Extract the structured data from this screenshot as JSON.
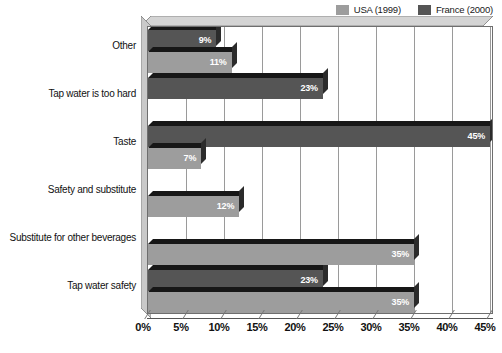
{
  "chart_data": {
    "type": "bar",
    "orientation": "horizontal",
    "title": "",
    "subtitle": "",
    "xlabel": "",
    "ylabel": "",
    "xlim": [
      0,
      45
    ],
    "xtick_labels": [
      "0%",
      "5%",
      "10%",
      "15%",
      "20%",
      "25%",
      "30%",
      "35%",
      "40%",
      "45%"
    ],
    "xtick_values": [
      0,
      5,
      10,
      15,
      20,
      25,
      30,
      35,
      40,
      45
    ],
    "grid": "vertical",
    "legend_position": "top-right",
    "categories": [
      "Other",
      "Tap water is too hard",
      "Taste",
      "Safety and substitute",
      "Substitute for other beverages",
      "Tap water safety"
    ],
    "series": [
      {
        "name": "USA (1999)",
        "color": "#9d9d9d",
        "values": [
          11,
          0,
          7,
          12,
          35,
          35
        ],
        "labels": [
          "11%",
          "",
          "7%",
          "12%",
          "35%",
          "35%"
        ]
      },
      {
        "name": "France (2000)",
        "color": "#555555",
        "values": [
          9,
          23,
          45,
          0,
          0,
          23
        ],
        "labels": [
          "9%",
          "23%",
          "45%",
          "",
          "",
          "23%"
        ]
      }
    ]
  },
  "legend": {
    "entries": [
      {
        "label": "USA (1999)",
        "color": "#9d9d9d"
      },
      {
        "label": "France (2000)",
        "color": "#555555"
      }
    ]
  }
}
